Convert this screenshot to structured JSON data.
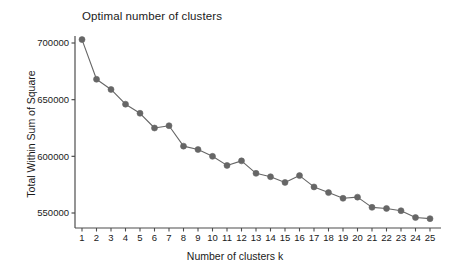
{
  "chart_data": {
    "type": "line",
    "title": "Optimal number of clusters",
    "xlabel": "Number of clusters k",
    "ylabel": "Total Within Sum of Square",
    "x": [
      1,
      2,
      3,
      4,
      5,
      6,
      7,
      8,
      9,
      10,
      11,
      12,
      13,
      14,
      15,
      16,
      17,
      18,
      19,
      20,
      21,
      22,
      23,
      24,
      25
    ],
    "values": [
      703000,
      668000,
      659000,
      646000,
      638000,
      625000,
      627000,
      609000,
      606000,
      600000,
      592000,
      596000,
      585000,
      582000,
      577000,
      583000,
      573000,
      568000,
      563000,
      564000,
      555000,
      554000,
      552000,
      546000,
      545000
    ],
    "xticklabels": [
      "1",
      "2",
      "3",
      "4",
      "5",
      "6",
      "7",
      "8",
      "9",
      "10",
      "11",
      "12",
      "13",
      "14",
      "15",
      "16",
      "17",
      "18",
      "19",
      "20",
      "21",
      "22",
      "23",
      "24",
      "25"
    ],
    "yticks": [
      550000,
      600000,
      650000,
      700000
    ],
    "yticklabels": [
      "550000",
      "600000",
      "650000",
      "700000"
    ],
    "xlim": [
      0.5,
      25.5
    ],
    "ylim": [
      540000,
      708000
    ],
    "grid": false,
    "legend": null,
    "series_color": "#666666",
    "marker": "circle",
    "marker_size": 3,
    "line_width": 1.1,
    "axis_color": "#4d4d4d",
    "background_color": "#ffffff"
  },
  "axes": {
    "y_axis_name": "y-axis",
    "x_axis_name": "x-axis"
  }
}
